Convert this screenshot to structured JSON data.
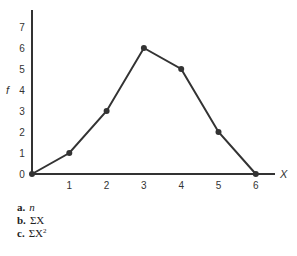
{
  "chart_data": {
    "type": "line",
    "title": "",
    "xlabel": "X",
    "ylabel": "f",
    "x": [
      0,
      1,
      2,
      3,
      4,
      5,
      6
    ],
    "series": [
      {
        "name": "f",
        "values": [
          0,
          1,
          3,
          6,
          5,
          2,
          0
        ]
      }
    ],
    "x_ticks": [
      "0",
      "1",
      "2",
      "3",
      "4",
      "5",
      "6"
    ],
    "y_ticks": [
      "0",
      "1",
      "2",
      "3",
      "4",
      "5",
      "6",
      "7"
    ],
    "xlim": [
      0,
      6.5
    ],
    "ylim": [
      0,
      7.5
    ],
    "grid": false,
    "legend": "none",
    "markers": true,
    "color": "#333333"
  },
  "questions": [
    {
      "label": "a.",
      "text": "n",
      "italic": true
    },
    {
      "label": "b.",
      "text": "ΣX"
    },
    {
      "label": "c.",
      "text": "ΣX",
      "sup": "2"
    }
  ]
}
